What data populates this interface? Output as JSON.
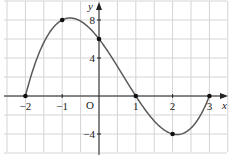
{
  "chart_data": {
    "type": "line",
    "title": "",
    "xlabel": "x",
    "ylabel": "y",
    "origin_label": "O",
    "function": "f(x) = (x+2)(x-1)(x-3)",
    "xlim": [
      -2.5,
      3.4
    ],
    "ylim": [
      -5.9,
      9.3
    ],
    "grid": true,
    "x_ticks": [
      {
        "value": -2,
        "label": "−2"
      },
      {
        "value": -1,
        "label": "−1"
      },
      {
        "value": 1,
        "label": "1"
      },
      {
        "value": 2,
        "label": "2"
      },
      {
        "value": 3,
        "label": "3"
      }
    ],
    "y_ticks": [
      {
        "value": 8,
        "label": "8"
      },
      {
        "value": 4,
        "label": "4"
      },
      {
        "value": -4,
        "label": "−4"
      }
    ],
    "marked_points": [
      {
        "x": -2,
        "y": 0
      },
      {
        "x": -1,
        "y": 8
      },
      {
        "x": 0,
        "y": 6
      },
      {
        "x": 1,
        "y": 0
      },
      {
        "x": 2,
        "y": -4
      },
      {
        "x": 3,
        "y": 0
      }
    ],
    "series": [
      {
        "name": "f(x)",
        "x_range": [
          -2,
          3
        ],
        "color": "#555555"
      }
    ]
  },
  "colors": {
    "grid": "#d4d4d4",
    "axis": "#222222",
    "curve": "#5a5a5a",
    "point": "#111111"
  }
}
